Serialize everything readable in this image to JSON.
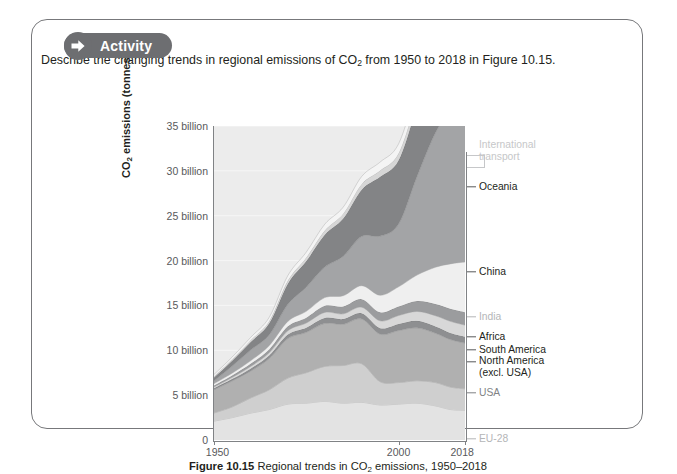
{
  "panel": {
    "header_label": "Activity",
    "header_icon": "arrow-right-icon",
    "prompt_part1": "Describe the changing trends in regional emissions of CO",
    "prompt_sub": "2",
    "prompt_part2": " from 1950 to 2018 in Figure 10.15."
  },
  "caption": {
    "figure_number": "Figure 10.15",
    "text_part1": " Regional trends in CO",
    "sub": "2",
    "text_part2": " emissions, 1950–2018"
  },
  "chart_data": {
    "type": "area",
    "xlabel": "",
    "ylabel": "CO2 emissions (tonnes)",
    "ylabel_sub": "2",
    "xlim": [
      1950,
      2018
    ],
    "ylim": [
      0,
      35
    ],
    "y_unit": "billion",
    "grid": true,
    "legend_position": "right",
    "y_ticks": [
      0,
      5,
      10,
      15,
      20,
      25,
      30,
      35
    ],
    "y_tick_labels": [
      "0",
      "5 billion",
      "10 billion",
      "15 billion",
      "20 billion",
      "25 billion",
      "30 billion",
      "35 billion"
    ],
    "x_ticks": [
      1950,
      2000,
      2018
    ],
    "x_tick_labels": [
      "1950",
      "2000",
      "2018"
    ],
    "x": [
      1950,
      1955,
      1960,
      1965,
      1970,
      1975,
      1980,
      1985,
      1990,
      1995,
      2000,
      2005,
      2010,
      2014,
      2018
    ],
    "series": [
      {
        "name": "EU-28",
        "label": "EU-28",
        "color": "#e3e3e3",
        "label_color": "#b4b5b7",
        "tick_color": "#b4b5b7",
        "values": [
          2.1,
          2.5,
          3.0,
          3.4,
          4.0,
          4.1,
          4.3,
          4.1,
          4.2,
          3.9,
          4.0,
          4.1,
          3.8,
          3.4,
          3.3
        ]
      },
      {
        "name": "Europe (excl. EU-28)",
        "label": "Europe (excl.\nEU-28)",
        "color": "#cfcfcf",
        "label_color": "#b4b5b7",
        "tick_color": "#b4b5b7",
        "values": [
          0.9,
          1.2,
          1.7,
          2.2,
          2.9,
          3.4,
          3.9,
          4.2,
          4.3,
          2.6,
          2.4,
          2.5,
          2.6,
          2.5,
          2.4
        ]
      },
      {
        "name": "USA",
        "label": "USA",
        "color": "#b0b0b0",
        "label_color": "#808285",
        "tick_color": "#808285",
        "values": [
          2.6,
          2.9,
          3.0,
          3.5,
          4.4,
          4.5,
          4.8,
          4.6,
          5.0,
          5.3,
          5.8,
          5.9,
          5.5,
          5.3,
          5.1
        ]
      },
      {
        "name": "North America (excl. USA)",
        "label": "North America\n(excl. USA)",
        "color": "#8e8f91",
        "label_color": "#231f20",
        "tick_color": "#58595b",
        "values": [
          0.18,
          0.22,
          0.28,
          0.34,
          0.45,
          0.52,
          0.6,
          0.58,
          0.62,
          0.66,
          0.72,
          0.78,
          0.75,
          0.73,
          0.72
        ]
      },
      {
        "name": "South America",
        "label": "South America",
        "color": "#d8d8d8",
        "label_color": "#231f20",
        "tick_color": "#58595b",
        "values": [
          0.12,
          0.17,
          0.24,
          0.3,
          0.42,
          0.52,
          0.62,
          0.58,
          0.68,
          0.82,
          0.95,
          1.05,
          1.2,
          1.3,
          1.28
        ]
      },
      {
        "name": "Africa",
        "label": "Africa",
        "color": "#9b9c9e",
        "label_color": "#231f20",
        "tick_color": "#58595b",
        "values": [
          0.18,
          0.23,
          0.3,
          0.38,
          0.5,
          0.6,
          0.75,
          0.82,
          0.9,
          0.95,
          1.0,
          1.15,
          1.3,
          1.4,
          1.45
        ]
      },
      {
        "name": "India",
        "label": "India",
        "color": "#efefef",
        "label_color": "#b4b5b7",
        "tick_color": "#b4b5b7",
        "values": [
          0.2,
          0.25,
          0.33,
          0.42,
          0.55,
          0.7,
          0.9,
          1.2,
          1.5,
          1.9,
          2.2,
          2.9,
          4.1,
          5.0,
          5.6
        ]
      },
      {
        "name": "China",
        "label": "China",
        "color": "#a3a4a6",
        "label_color": "#231f20",
        "tick_color": "#58595b",
        "values": [
          0.3,
          0.8,
          1.2,
          1.2,
          1.9,
          2.7,
          3.4,
          4.4,
          5.5,
          6.6,
          7.0,
          11.0,
          15.0,
          17.0,
          17.5
        ]
      },
      {
        "name": "Asia (excl. China and India)",
        "label": "Asia (excl.\nChina and India)",
        "color": "#838486",
        "label_color": "#231f20",
        "tick_color": "#58595b",
        "values": [
          0.4,
          0.6,
          0.9,
          1.3,
          2.3,
          2.9,
          3.6,
          4.2,
          5.2,
          6.6,
          7.1,
          7.8,
          8.9,
          9.6,
          10.0
        ]
      },
      {
        "name": "Oceania",
        "label": "Oceania",
        "color": "#d6d6d6",
        "label_color": "#231f20",
        "tick_color": "#58595b",
        "values": [
          0.12,
          0.16,
          0.2,
          0.26,
          0.35,
          0.4,
          0.48,
          0.55,
          0.62,
          0.7,
          0.78,
          0.85,
          0.95,
          1.0,
          1.05
        ]
      },
      {
        "name": "International transport",
        "label": "International\ntransport",
        "color": "#f4f4f4",
        "label_color": "#c6c7c9",
        "tick_color": "#c6c7c9",
        "values": [
          0.2,
          0.25,
          0.32,
          0.4,
          0.55,
          0.6,
          0.7,
          0.72,
          0.85,
          0.95,
          1.05,
          1.2,
          1.3,
          1.35,
          1.4
        ]
      }
    ],
    "totals_note": "Stacked totals reach approximately 35 billion tonnes in 2018"
  },
  "legend_layout": [
    {
      "key": "international-transport",
      "y": 88,
      "label_y": 83,
      "bracket": true
    },
    {
      "key": "oceania",
      "y": 119,
      "label_y": 119,
      "bracket": false
    },
    {
      "key": "asia-excl-china-india",
      "y": 139,
      "label_y": 143,
      "bracket": false
    },
    {
      "key": "china",
      "y": 204,
      "label_y": 204,
      "bracket": false
    },
    {
      "key": "india",
      "y": 249,
      "label_y": 249,
      "bracket": false
    },
    {
      "key": "africa",
      "y": 269,
      "label_y": 269,
      "bracket": false
    },
    {
      "key": "south-america",
      "y": 282,
      "label_y": 282,
      "bracket": false
    },
    {
      "key": "north-america-excl-usa",
      "y": 294,
      "label_y": 299,
      "bracket": false
    },
    {
      "key": "usa",
      "y": 325,
      "label_y": 325,
      "bracket": false
    },
    {
      "key": "europe-excl-eu28",
      "y": 349,
      "label_y": 352,
      "bracket": false
    },
    {
      "key": "eu-28",
      "y": 371,
      "label_y": 371,
      "bracket": false
    }
  ]
}
